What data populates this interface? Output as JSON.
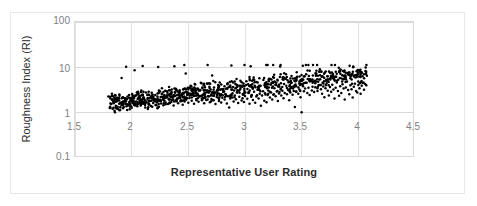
{
  "chart_data": {
    "type": "scatter",
    "title": "",
    "xlabel": "Representative User Rating",
    "ylabel": "Roughness Index (RI)",
    "xlim": [
      1.5,
      4.5
    ],
    "ylim": [
      0.1,
      100
    ],
    "yscale": "log",
    "xscale": "linear",
    "grid": true,
    "legend": "none",
    "marker": "filled-circle",
    "marker_color": "#000000",
    "marker_size_px": 2,
    "xticks": [
      1.5,
      2,
      2.5,
      3,
      3.5,
      4,
      4.5
    ],
    "xtick_labels": [
      "1.5",
      "2",
      "2.5",
      "3",
      "3.5",
      "4",
      "4.5"
    ],
    "yticks": [
      0.1,
      1,
      10,
      100
    ],
    "ytick_labels": [
      "0.1",
      "1",
      "10",
      "100"
    ],
    "n_points": 1000,
    "x_data_range": [
      1.8,
      4.07
    ],
    "y_data_range": [
      0.95,
      11.2
    ],
    "series": [
      {
        "name": "Roughness Index vs Representative User Rating",
        "points": [
          [
            1.81,
            1.35
          ],
          [
            1.82,
            1.55
          ],
          [
            1.83,
            1.95
          ],
          [
            1.84,
            1.62
          ],
          [
            1.85,
            2.1
          ],
          [
            1.86,
            1.42
          ],
          [
            1.87,
            1.78
          ],
          [
            1.88,
            1.2
          ],
          [
            1.89,
            2.05
          ],
          [
            1.9,
            1.66
          ],
          [
            1.91,
            1.5
          ],
          [
            1.92,
            2.2
          ],
          [
            1.93,
            1.34
          ],
          [
            1.94,
            1.82
          ],
          [
            1.95,
            1.58
          ],
          [
            1.96,
            2.0
          ],
          [
            1.97,
            1.45
          ],
          [
            1.98,
            1.72
          ],
          [
            1.99,
            1.9
          ],
          [
            2.0,
            1.28
          ],
          [
            2.01,
            1.62
          ],
          [
            2.02,
            2.08
          ],
          [
            2.03,
            1.5
          ],
          [
            2.04,
            1.76
          ],
          [
            2.05,
            1.38
          ],
          [
            2.06,
            2.15
          ],
          [
            2.07,
            1.68
          ],
          [
            2.08,
            1.44
          ],
          [
            2.09,
            1.85
          ],
          [
            2.1,
            1.58
          ],
          [
            2.11,
            1.96
          ],
          [
            2.12,
            1.3
          ],
          [
            2.13,
            1.7
          ],
          [
            2.14,
            2.02
          ],
          [
            2.15,
            1.52
          ],
          [
            2.16,
            1.8
          ],
          [
            2.17,
            1.4
          ],
          [
            2.18,
            2.12
          ],
          [
            2.19,
            1.64
          ],
          [
            2.2,
            1.88
          ],
          [
            2.21,
            1.48
          ],
          [
            2.22,
            1.74
          ],
          [
            2.23,
            2.06
          ],
          [
            2.24,
            1.35
          ],
          [
            2.25,
            1.92
          ],
          [
            2.26,
            1.6
          ],
          [
            2.27,
            2.25
          ],
          [
            2.28,
            1.46
          ],
          [
            2.29,
            1.84
          ],
          [
            2.3,
            1.68
          ],
          [
            2.31,
            2.4
          ],
          [
            2.32,
            1.55
          ],
          [
            2.33,
            1.98
          ],
          [
            2.34,
            2.6
          ],
          [
            2.35,
            1.72
          ],
          [
            2.36,
            2.15
          ],
          [
            2.37,
            1.44
          ],
          [
            2.38,
            2.85
          ],
          [
            2.39,
            1.86
          ],
          [
            2.4,
            2.05
          ],
          [
            2.41,
            1.62
          ],
          [
            2.42,
            2.35
          ],
          [
            2.43,
            1.78
          ],
          [
            2.44,
            2.55
          ],
          [
            2.45,
            1.5
          ],
          [
            2.46,
            2.2
          ],
          [
            2.47,
            3.4
          ],
          [
            2.48,
            1.92
          ],
          [
            2.49,
            2.7
          ],
          [
            2.5,
            1.66
          ],
          [
            2.51,
            2.1
          ],
          [
            2.52,
            3.9
          ],
          [
            2.53,
            1.84
          ],
          [
            2.54,
            2.45
          ],
          [
            2.55,
            1.58
          ],
          [
            2.56,
            4.2
          ],
          [
            2.57,
            2.0
          ],
          [
            2.58,
            2.65
          ],
          [
            2.59,
            1.74
          ],
          [
            2.6,
            2.3
          ],
          [
            2.61,
            4.55
          ],
          [
            2.62,
            1.88
          ],
          [
            2.63,
            2.5
          ],
          [
            2.64,
            1.62
          ],
          [
            2.65,
            2.18
          ],
          [
            2.66,
            3.1
          ],
          [
            2.67,
            1.96
          ],
          [
            2.68,
            2.75
          ],
          [
            2.69,
            1.7
          ],
          [
            2.7,
            2.38
          ],
          [
            2.71,
            6.6
          ],
          [
            2.72,
            1.9
          ],
          [
            2.73,
            2.6
          ],
          [
            2.74,
            1.56
          ],
          [
            2.75,
            2.22
          ],
          [
            2.76,
            3.3
          ],
          [
            2.77,
            1.82
          ],
          [
            2.78,
            2.48
          ],
          [
            2.79,
            1.68
          ],
          [
            2.8,
            2.12
          ],
          [
            2.81,
            2.9
          ],
          [
            2.82,
            1.94
          ],
          [
            2.83,
            2.55
          ],
          [
            2.84,
            1.6
          ],
          [
            2.85,
            2.3
          ],
          [
            2.86,
            1.3
          ],
          [
            2.87,
            2.05
          ],
          [
            2.88,
            11.0
          ],
          [
            2.89,
            2.68
          ],
          [
            2.9,
            1.76
          ],
          [
            2.91,
            2.4
          ],
          [
            2.92,
            1.98
          ],
          [
            2.93,
            2.82
          ],
          [
            2.94,
            1.64
          ],
          [
            2.95,
            2.25
          ],
          [
            2.96,
            3.5
          ],
          [
            2.97,
            1.86
          ],
          [
            2.98,
            2.58
          ],
          [
            2.99,
            1.72
          ],
          [
            3.0,
            2.34
          ],
          [
            3.01,
            4.1
          ],
          [
            3.02,
            2.02
          ],
          [
            3.03,
            2.7
          ],
          [
            3.04,
            1.58
          ],
          [
            3.05,
            10.5
          ],
          [
            3.06,
            2.45
          ],
          [
            3.07,
            1.9
          ],
          [
            3.08,
            2.88
          ],
          [
            3.09,
            1.66
          ],
          [
            3.1,
            2.28
          ],
          [
            3.11,
            3.2
          ],
          [
            3.12,
            2.06
          ],
          [
            3.13,
            2.62
          ],
          [
            3.14,
            1.42
          ],
          [
            3.15,
            2.38
          ],
          [
            3.16,
            2.95
          ],
          [
            3.17,
            1.84
          ],
          [
            3.18,
            2.52
          ],
          [
            3.19,
            1.7
          ],
          [
            3.2,
            2.44
          ],
          [
            3.21,
            3.6
          ],
          [
            3.22,
            2.16
          ],
          [
            3.23,
            2.78
          ],
          [
            3.24,
            1.96
          ],
          [
            3.25,
            2.5
          ],
          [
            3.26,
            4.8
          ],
          [
            3.27,
            2.3
          ],
          [
            3.28,
            2.92
          ],
          [
            3.29,
            1.8
          ],
          [
            3.3,
            2.65
          ],
          [
            3.31,
            10.4
          ],
          [
            3.32,
            2.4
          ],
          [
            3.33,
            3.05
          ],
          [
            3.34,
            2.08
          ],
          [
            3.35,
            2.72
          ],
          [
            3.36,
            5.6
          ],
          [
            3.37,
            2.55
          ],
          [
            3.38,
            3.15
          ],
          [
            3.39,
            1.88
          ],
          [
            3.4,
            2.8
          ],
          [
            3.41,
            3.7
          ],
          [
            3.42,
            2.48
          ],
          [
            3.43,
            3.0
          ],
          [
            3.44,
            1.34
          ],
          [
            3.45,
            2.88
          ],
          [
            3.46,
            6.2
          ],
          [
            3.47,
            2.62
          ],
          [
            3.48,
            3.25
          ],
          [
            3.49,
            2.2
          ],
          [
            3.5,
            1.02
          ],
          [
            3.51,
            10.8
          ],
          [
            3.52,
            2.95
          ],
          [
            3.53,
            3.4
          ],
          [
            3.54,
            7.0
          ],
          [
            3.55,
            2.7
          ],
          [
            3.56,
            3.55
          ],
          [
            3.57,
            2.45
          ],
          [
            3.58,
            5.2
          ],
          [
            3.59,
            3.1
          ],
          [
            3.6,
            11.2
          ],
          [
            3.61,
            2.85
          ],
          [
            3.62,
            3.65
          ],
          [
            3.63,
            8.4
          ],
          [
            3.64,
            3.0
          ],
          [
            3.65,
            4.0
          ],
          [
            3.66,
            9.1
          ],
          [
            3.67,
            3.3
          ],
          [
            3.68,
            2.6
          ],
          [
            3.69,
            3.8
          ],
          [
            3.7,
            2.2
          ],
          [
            3.71,
            3.45
          ],
          [
            3.72,
            4.4
          ],
          [
            3.73,
            3.05
          ],
          [
            3.74,
            2.4
          ],
          [
            3.75,
            3.7
          ],
          [
            3.76,
            2.9
          ],
          [
            3.77,
            4.15
          ],
          [
            3.78,
            3.25
          ],
          [
            3.79,
            2.05
          ],
          [
            3.8,
            3.55
          ],
          [
            3.81,
            4.6
          ],
          [
            3.82,
            3.0
          ],
          [
            3.83,
            2.35
          ],
          [
            3.84,
            3.85
          ],
          [
            3.85,
            2.7
          ],
          [
            3.86,
            4.25
          ],
          [
            3.87,
            3.4
          ],
          [
            3.88,
            1.95
          ],
          [
            3.89,
            3.6
          ],
          [
            3.9,
            4.9
          ],
          [
            3.91,
            3.15
          ],
          [
            3.92,
            2.55
          ],
          [
            3.93,
            4.05
          ],
          [
            3.94,
            3.3
          ],
          [
            3.95,
            2.15
          ],
          [
            3.96,
            3.75
          ],
          [
            3.97,
            4.35
          ],
          [
            3.98,
            3.0
          ],
          [
            3.99,
            2.8
          ],
          [
            4.0,
            4.1
          ],
          [
            4.01,
            3.45
          ],
          [
            4.02,
            2.6
          ],
          [
            4.03,
            3.9
          ],
          [
            4.04,
            4.5
          ],
          [
            4.05,
            3.2
          ],
          [
            4.06,
            4.3
          ],
          [
            4.07,
            4.0
          ]
        ]
      }
    ]
  },
  "axes": {
    "x_title": "Representative User Rating",
    "y_title": "Roughness Index (RI)",
    "x_tick_labels": [
      "1.5",
      "2",
      "2.5",
      "3",
      "3.5",
      "4",
      "4.5"
    ],
    "y_tick_labels": [
      "100",
      "10",
      "1",
      "0.1"
    ]
  },
  "colors": {
    "marker": "#000000",
    "grid": "#d9d9d9",
    "frame": "#d9d9d9",
    "tick_text": "#808080",
    "title_text": "#2b2b2b",
    "background": "#ffffff"
  }
}
